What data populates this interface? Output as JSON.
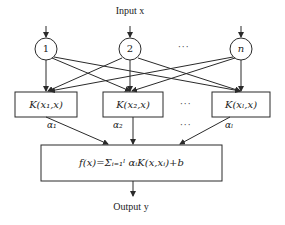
{
  "diagram": {
    "type": "SVM network structure",
    "input_label": "Input x",
    "output_label": "Output y",
    "input_nodes": [
      {
        "label": "1"
      },
      {
        "label": "2"
      },
      {
        "label": "n"
      }
    ],
    "input_ellipsis": "···",
    "kernel_nodes": [
      {
        "label": "K(x₁,x)"
      },
      {
        "label": "K(x₂,x)"
      },
      {
        "label": "K(xₗ,x)"
      }
    ],
    "kernel_ellipsis": "···",
    "weights": [
      {
        "label": "α₁"
      },
      {
        "label": "α₂"
      },
      {
        "label": "αₗ"
      }
    ],
    "weight_ellipsis": "···",
    "output_formula": "f(x)=Σᵢ₌₁ˡ αᵢK(x,xᵢ)+b",
    "colors": {
      "stroke": "#2a2a2a",
      "background": "#ffffff"
    }
  }
}
